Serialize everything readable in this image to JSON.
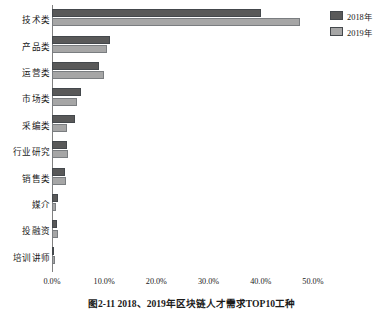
{
  "chart_data": {
    "type": "bar",
    "orientation": "horizontal",
    "title": "",
    "caption": "图2-11  2018、2019年区块链人才需求TOP10工种",
    "categories": [
      "技术类",
      "产品类",
      "运营类",
      "市场类",
      "采编类",
      "行业研究",
      "销售类",
      "媒介",
      "投融资",
      "培训讲师"
    ],
    "series": [
      {
        "name": "2018年",
        "color": "#595959",
        "values": [
          40.0,
          11.2,
          9.0,
          5.6,
          4.4,
          2.8,
          2.4,
          1.2,
          1.0,
          0.4
        ]
      },
      {
        "name": "2019年",
        "color": "#a6a6a6",
        "values": [
          47.5,
          10.6,
          10.0,
          4.7,
          2.9,
          3.0,
          2.7,
          0.7,
          1.1,
          0.5
        ]
      }
    ],
    "xlabel": "",
    "ylabel": "",
    "xlim": [
      0,
      55
    ],
    "xticks": [
      0,
      10,
      20,
      30,
      40,
      50
    ],
    "xtick_labels": [
      "0.0%",
      "10.0%",
      "20.0%",
      "30.0%",
      "40.0%",
      "50.0%"
    ],
    "grid": false,
    "legend_position": "top-right"
  },
  "legend": {
    "items": [
      {
        "label": "2018年",
        "color": "#595959"
      },
      {
        "label": "2019年",
        "color": "#a6a6a6"
      }
    ]
  },
  "colors": {
    "series_2018": "#595959",
    "series_2019": "#a6a6a6",
    "axis": "#808080",
    "text": "#1a1a1a",
    "background": "#ffffff"
  }
}
